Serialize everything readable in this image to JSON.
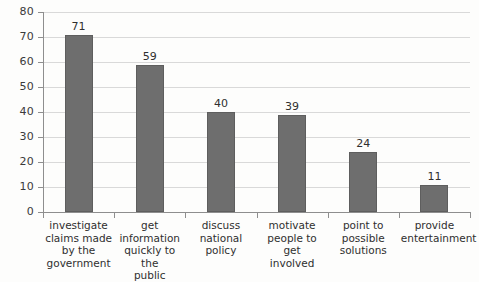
{
  "chart_data": {
    "type": "bar",
    "title": "",
    "subtitle": "",
    "xlabel": "",
    "ylabel": "",
    "ylim": [
      0,
      80
    ],
    "ytick_step": 10,
    "yticks": [
      "0",
      "10",
      "20",
      "30",
      "40",
      "50",
      "60",
      "70",
      "80"
    ],
    "grid": true,
    "legend": false,
    "legend_position": "none",
    "categories": [
      "investigate claims made by the government",
      "get information quickly to the public",
      "discuss national policy",
      "motivate people to get involved",
      "point to possible solutions",
      "provide entertainment"
    ],
    "category_lines": [
      [
        "investigate",
        "claims made",
        "by the",
        "government"
      ],
      [
        "get",
        "information",
        "quickly to the",
        "public"
      ],
      [
        "discuss",
        "national",
        "policy"
      ],
      [
        "motivate",
        "people to get",
        "involved"
      ],
      [
        "point to",
        "possible",
        "solutions"
      ],
      [
        "provide",
        "entertainment"
      ]
    ],
    "values": [
      71,
      59,
      40,
      39,
      24,
      11
    ],
    "value_labels": [
      "71",
      "59",
      "40",
      "39",
      "24",
      "11"
    ],
    "colors": {
      "bar_fill": "#6e6e6e",
      "bar_edge": "#5e5e5e",
      "gridline": "#d9d9d9",
      "axis": "#8e8e8e",
      "text": "#2f2f2f",
      "background": "#fdfdfc"
    }
  }
}
